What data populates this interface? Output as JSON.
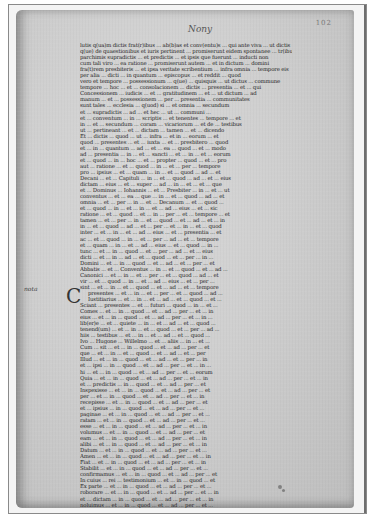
{
  "document": {
    "type": "medieval-manuscript-folio",
    "heading": "Nony",
    "folio_number": "102",
    "margin_note": "nota",
    "initial_letter": "C",
    "text_lines": [
      "lutis q(ua)m dictis frat(r)ibus ... ab(b)as et conv(entu)s ... qui ante viva ... ut dictis",
      "q(ue) de quaestionibus et iuris pertinent ... promiserunt eidem spontanee ... tr(ibus) &",
      "parchimis supradictis ... et predictis ... et ipsis que fuerunt ... inducti non",
      "cum tali viro ... ea ratione ... promiserunt autem ... et in dictum ... domini",
      "fra(t)rem presbiteris ... et ipsa veritate scribentium ... infra omnia ... tempore eis",
      "per alia ... dicti ... in quantum ... episcopus ... et reddit ... quod",
      "vero et tempore ... possessionum ... q(ue) ... quisquis ... ut dictus ... commune",
      "tempore ... hoc ... et ... consolacionem ... dictis ... presentia ... et ... qui",
      "Concessionem ... iudicis ... et ... gratitudinem ... et ... ut dictum ... ad",
      "manum ... et ... possessionem ... per ... presentia ... communitates",
      "sunt tales ... ecclesia ... q(uod) si ... et omnia ... secundum",
      "et ... supradictis ... ad ... et hec ... ut ... communi ...",
      "et ... conventum ... in ... scriptis ... et tenentes ... tempore ... et",
      "in ... et ... secundum ... coram ... vicariorum ... et de ... testibus",
      "ut ... pertineant ... et ... dictam ... tamen ... et ... dicendo",
      "Et ... dictis ... quod ... ut ... infra ... et in ... eorum ... et",
      "quod ... presentes ... et ... iuxta ... et ... presbitero ... quod",
      "et ... in ... quantum ... ad ... et ... ea ... quod ... et ... modo",
      "ad ... presentia ... in ... et ... sancti ... et ... in ... et ... eorum",
      "et ... quod ... in ... hoc ... et ... propter ... quod ... et ... pro",
      "aut ... ratione ... et ... quod ... in ... et ... per ... tempore",
      "pro ... ipsius ... et ... quam ... in ... et ... quod ... ad ... et",
      "Decani ... et ... Capituli ... in ... et ... quod ... ad ... et ... eius",
      "dictam ... eius ... et ... super ... ad ... in ... et ... et ... que",
      "et ... Dominus ... Iohannis ... et ... Presbiter ... in ... et ... ut",
      "conventus ... et ... ea ... que ... in ... et ... quod ... ad ... et",
      "omnia ... et ... per ... in ... et ... Decanum ... et ... quod ...",
      "et ... quod ... in ... et ... in ... et ... ad ... eius ... et ... sic",
      "ratione ... et ... quod ... et ... in ... per ... et ... tempore ... et",
      "tamen ... et ... per ... in ... et ... quod ... et ... ad ... et ... in",
      "in ... et ... quod ... ad ... et ... per ... et ... in ... et ... quod",
      "inter ... et ... in ... et ... ad ... eius ... et ... presentia ... et",
      "ac ... et ... quod ... in ... et ... per ... ad ... et ... tempore",
      "et ... quam ... in ... et ... ad ... eius ... et ... quod ... in ...",
      "tunc ... et ... in ... quod ... et ... per ... ad ... et ... eius",
      "dicti ... et ... in ... ad ... et ... quod ... et ... per ... in ...",
      "Domini ... et ... in ... quod ... et ... ad ... et ... per ... et",
      "Abbatis ... et ... Conventus ... in ... et ... quod ... et ... ad ...",
      "Canonici ... et ... in ... et ... per ... et ... quod ... ad ... et",
      "vir ... et ... quod ... in ... et ... ad ... eius ... et ... per ...",
      "sint ... et ... in ... et ... quod ... et ... ad ... et ... tempore",
      "presentes ... et ... in ... et ... per ... et ... quod ... ad ...",
      "Iustitiarius ... et ... in ... et ... ad ... et ... quod ... et ...",
      "Sciant ... presentes ... et ... futuri ... quod ... in ... et ...",
      "Comes ... et ... in ... quod ... et ... ad ... per ... et ... in",
      "eius ... et ... in ... quod ... et ... ad ... per ... et ... in ...",
      "lib(er)e ... et ... quiete ... in ... et ... ad ... et ... quod ...",
      "tenend(um) ... et ... in ... et ... quod ... et ... per ... ad ...",
      "hiis ... testibus ... et ... in ... et ... ad ... et ... quod ...",
      "Ivo ... Hugone ... Willelmo ... et ... aliis ... in ... et ...",
      "Cum ... sit ... et ... in ... quod ... et ... ad ... per ... et",
      "que ... et ... in ... et ... quod ... et ... ad ... et ... per",
      "Illud ... et ... in ... quod ... et ... ad ... et ... per ... in",
      "et ... ipsi ... in ... quod ... et ... ad ... per ... et ... in ...",
      "hi ... et ... in ... quod ... et ... ad ... per ... et ... eorum",
      "Quia ... et ... in ... quod ... et ... ad ... per ... et ... in",
      "et ... predictis ... in ... quod ... et ... ad ... per ... et",
      "Inspexisse ... et ... in ... quod ... et ... ad ... per ... et",
      "per ... et ... in ... quod ... et ... ad ... per ... et ... in",
      "recepisse ... et ... in ... quod ... et ... ad ... per ... et",
      "et ... ipsius ... in ... quod ... et ... ad ... per ... et ...",
      "paginae ... et ... in ... quod ... et ... ad ... per ... et ...",
      "ratam ... et ... in ... quod ... et ... ad ... per ... et ...",
      "esse ... et ... in ... quod ... et ... ad ... per ... et ... in",
      "volumus ... et ... in ... quod ... et ... ad ... per ... et",
      "eam ... et ... in ... quod ... et ... ad ... per ... et ... in",
      "alibi ... et ... in ... quod ... et ... ad ... per ... et ... in",
      "Datum ... et ... in ... quod ... et ... ad ... per ... et ...",
      "Amen ... et ... in ... quod ... et ... ad ... per ... et ... in",
      "Fiat ... et ... in ... quod ... et ... ad ... per ... et ... in",
      "Stabilit ... et ... in ... quod ... et ... ad ... per ... et ...",
      "confirmamus ... et ... in ... quod ... et ... ad ... per ... et",
      "In cuius ... rei ... testimonium ... et ... in ... quod ... et",
      "Ex parte ... et ... in ... quod ... et ... ad ... per ... et ...",
      "roborare ... et ... in ... quod ... et ... ad ... per ... et ... in",
      "et ... dictam ... in ... quod ... et ... ad ... per ... et ... in",
      "noluimus ... et ... in ... quod ... et ... ad ... per ... et ...",
      "presenti ... et ... in ... quod ... et ... ad ... per ... et ...",
      "et ... ipsi ... in ... quod ... et ... ad ... per ... et ... in",
      "reddendo ... et ... in ... quod ... et ... ad ... per ... et ...",
      "et ... tunc ... in ... quod ... et ... ad ... per ... et ... in",
      "annuatim ... et ... in ... quod ... et ... ad ... per ... et ...",
      "Festum ... et ... in ... quod ... et ... ad ... per ... et ... in",
      "Michaelis ... et ... in ... quod ... et ... ad ... per ... et ...",
      "Pasche ... et ... in ... quod ... et ... ad ... per ... et ... in",
      "Nativitatis ... et ... in ... quod ... et ... ad ... per ... et",
      "et ... eius ... in ... quod ... et ... ad ... per ... et ... in",
      "Amen ... et ... in ... quod ... et ... ad ... per ... et ... in"
    ],
    "indented_line_indices": [
      41,
      42
    ],
    "initial_line_index": 41
  },
  "colors": {
    "frame_background": "#f4f4f4",
    "frame_border": "#8a8a8a",
    "parchment": "#cfcfcf",
    "ink": "#262626"
  }
}
